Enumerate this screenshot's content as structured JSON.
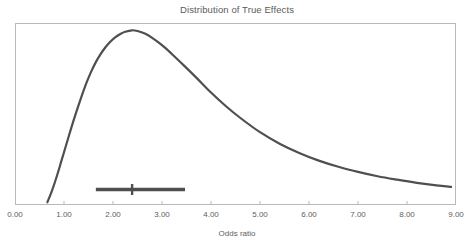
{
  "chart_data": {
    "type": "line",
    "title": "Distribution of True Effects",
    "xlabel": "Odds ratio",
    "ylabel": "",
    "xlim": [
      0.0,
      9.0
    ],
    "ylim": [
      0.0,
      1.0
    ],
    "grid": false,
    "legend": null,
    "xticks": [
      0.0,
      1.0,
      2.0,
      3.0,
      4.0,
      5.0,
      6.0,
      7.0,
      8.0,
      9.0
    ],
    "xtick_labels": [
      "0.00",
      "1.00",
      "2.00",
      "3.00",
      "4.00",
      "5.00",
      "6.00",
      "7.00",
      "8.00",
      "9.00"
    ],
    "series": [
      {
        "name": "Distribution of true effects",
        "type": "line",
        "color": "#4f4f4f",
        "line_width": 2.2,
        "x": [
          0.66,
          0.75,
          0.85,
          0.95,
          1.05,
          1.15,
          1.25,
          1.35,
          1.45,
          1.55,
          1.65,
          1.75,
          1.85,
          1.95,
          2.05,
          2.15,
          2.25,
          2.39,
          2.5,
          2.65,
          2.8,
          3.0,
          3.2,
          3.45,
          3.7,
          4.0,
          4.3,
          4.6,
          5.0,
          5.4,
          5.8,
          6.2,
          6.6,
          7.0,
          7.4,
          7.8,
          8.2,
          8.6,
          8.9
        ],
        "y": [
          0.015,
          0.075,
          0.155,
          0.245,
          0.335,
          0.425,
          0.51,
          0.59,
          0.665,
          0.73,
          0.785,
          0.83,
          0.868,
          0.898,
          0.922,
          0.94,
          0.952,
          0.96,
          0.956,
          0.942,
          0.918,
          0.878,
          0.83,
          0.766,
          0.7,
          0.618,
          0.544,
          0.478,
          0.4,
          0.337,
          0.286,
          0.244,
          0.21,
          0.182,
          0.158,
          0.139,
          0.122,
          0.108,
          0.1
        ]
      }
    ],
    "annotations": [
      {
        "type": "confidence-interval-bar",
        "label": "Confidence interval",
        "color": "#4f4f4f",
        "y_position": 0.085,
        "lower": 1.65,
        "point_estimate": 2.39,
        "upper": 3.47
      }
    ]
  },
  "figure": {
    "background_color": "#ffffff",
    "frame_color": "#b9b9b9",
    "text_color": "#5a5a5a"
  },
  "icons": {
    "ci_marker": "ci-point-marker"
  }
}
